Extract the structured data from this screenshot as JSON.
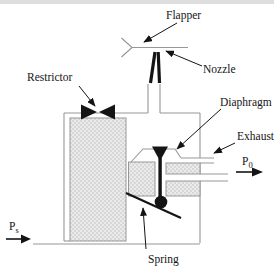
{
  "diagram": {
    "labels": {
      "flapper": "Flapper",
      "nozzle": "Nozzle",
      "restrictor": "Restrictor",
      "diaphragm": "Diaphragm",
      "exhaust": "Exhaust",
      "spring": "Spring",
      "p0_main": "P",
      "p0_sub": "0",
      "ps_main": "P",
      "ps_sub": "s"
    },
    "colors": {
      "line": "#979797",
      "ink": "#141414",
      "stipple_fill": "#ebebeb",
      "stipple_dot": "#b4b4b4",
      "background": "#ffffff",
      "scan_band": "#bdbdbd"
    }
  }
}
